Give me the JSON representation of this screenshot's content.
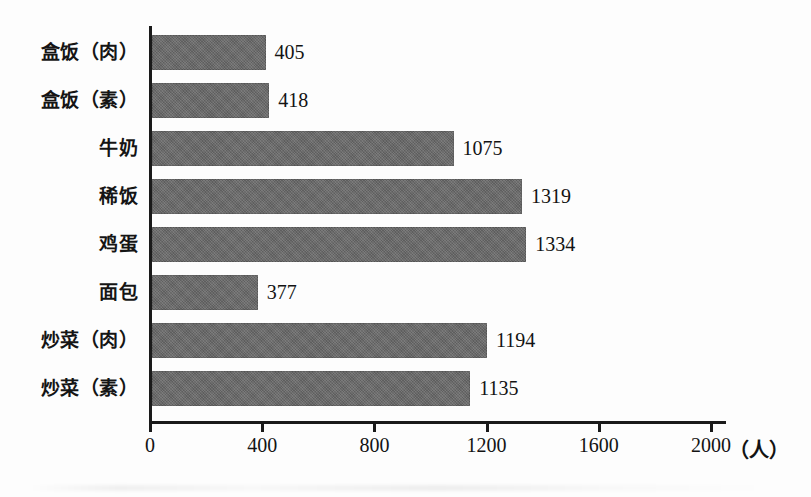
{
  "chart_data": {
    "type": "bar",
    "orientation": "horizontal",
    "title": "",
    "xlabel": "（人）",
    "ylabel": "",
    "categories": [
      "盒饭（肉）",
      "盒饭（素）",
      "牛奶",
      "稀饭",
      "鸡蛋",
      "面包",
      "炒菜（肉）",
      "炒菜（素）"
    ],
    "values": [
      405,
      418,
      1075,
      1319,
      1334,
      377,
      1194,
      1135
    ],
    "value_labels": [
      "405",
      "418",
      "1075",
      "1319",
      "1334",
      "377",
      "1194",
      "1135"
    ],
    "xlim": [
      0,
      2000
    ],
    "xticks": [
      0,
      400,
      800,
      1200,
      1600,
      2000
    ],
    "xtick_labels": [
      "0",
      "400",
      "800",
      "1200",
      "1600",
      "2000"
    ],
    "unit": "（人）",
    "grid": false,
    "legend": false,
    "bar_color": "#696969",
    "axis_color": "#1a1a1a",
    "text_color": "#131313",
    "background": "#fdfdfd"
  },
  "axis": {
    "unit_label": "（人）"
  }
}
